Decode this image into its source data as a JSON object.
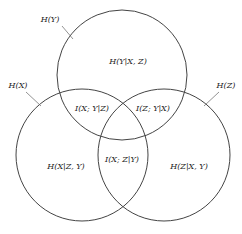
{
  "diagram": {
    "type": "venn-3",
    "stroke_color": "#444444",
    "sets": [
      {
        "id": "Y",
        "label": "H(Y)",
        "cx": 122,
        "cy": 75,
        "r": 65
      },
      {
        "id": "X",
        "label": "H(X)",
        "cx": 82,
        "cy": 155,
        "r": 66
      },
      {
        "id": "Z",
        "label": "H(Z)",
        "cx": 164,
        "cy": 155,
        "r": 66
      }
    ],
    "regions": {
      "y_only": "H(Y|X, Z)",
      "x_y": "I(X; Y|Z)",
      "z_y": "I(Z; Y|X)",
      "x_only": "H(X|Z, Y)",
      "x_z": "I(X; Z|Y)",
      "z_only": "H(Z|X, Y)"
    },
    "set_labels": {
      "Y": "H(Y)",
      "X": "H(X)",
      "Z": "H(Z)"
    }
  }
}
